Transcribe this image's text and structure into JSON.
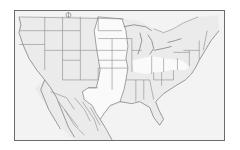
{
  "map": {
    "type": "outline-map",
    "region": "contiguous United States and northern Mexico",
    "colors": {
      "frame_border": "#6b6b6b",
      "background": "#efefef",
      "highlight_region": "#fafafa",
      "boundary_lines": "#8a8a8a"
    },
    "features": {
      "state_boundaries": true,
      "highlighted_region": "central plains (Dakotas through Texas) shown unshaded",
      "marker": "small circle symbol near northern border (Montana)"
    }
  }
}
